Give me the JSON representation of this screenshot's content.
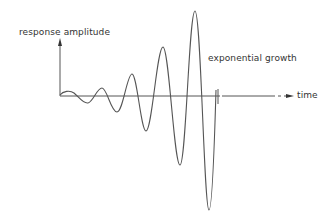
{
  "diagram": {
    "title": "",
    "labels": {
      "y_axis": "response amplitude",
      "x_axis": "time",
      "curve": "exponential growth"
    },
    "colors": {
      "line": "#555555",
      "text": "#333333",
      "background": "#ffffff"
    },
    "curve_points": [
      [
        60,
        95
      ],
      [
        66,
        91
      ],
      [
        73,
        93
      ],
      [
        80,
        97
      ],
      [
        87,
        103
      ],
      [
        95,
        97
      ],
      [
        102,
        88
      ],
      [
        109,
        99
      ],
      [
        117,
        112
      ],
      [
        125,
        92
      ],
      [
        132,
        74
      ],
      [
        139,
        100
      ],
      [
        146,
        131
      ],
      [
        155,
        90
      ],
      [
        163,
        47
      ],
      [
        171,
        100
      ],
      [
        180,
        165
      ],
      [
        188,
        60
      ],
      [
        195,
        11
      ],
      [
        202,
        100
      ],
      [
        209,
        210
      ]
    ]
  }
}
